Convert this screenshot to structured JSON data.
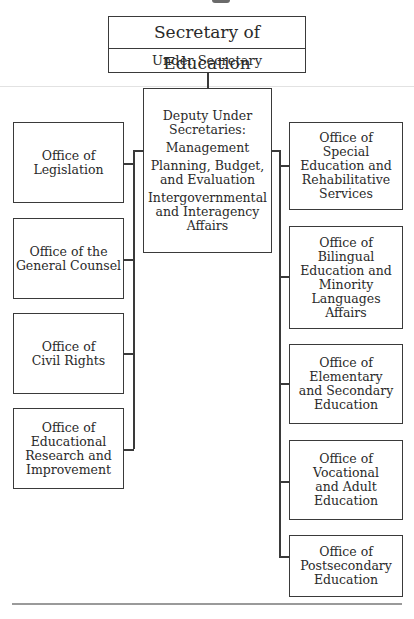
{
  "header": {
    "top": {
      "title": "Secretary of Education",
      "subtitle": "Under Secretary"
    }
  },
  "deputy": {
    "heading": [
      "Deputy Under",
      "Secretaries:"
    ],
    "items": [
      [
        "Management"
      ],
      [
        "Planning, Budget,",
        "and Evaluation"
      ],
      [
        "Intergovernmental",
        "and Interagency",
        "Affairs"
      ]
    ]
  },
  "left_offices": [
    {
      "lines": [
        "Office of",
        "Legislation"
      ]
    },
    {
      "lines": [
        "Office of the",
        "General Counsel"
      ]
    },
    {
      "lines": [
        "Office of",
        "Civil Rights"
      ]
    },
    {
      "lines": [
        "Office of",
        "Educational",
        "Research and",
        "Improvement"
      ]
    }
  ],
  "right_offices": [
    {
      "lines": [
        "Office of",
        "Special",
        "Education and",
        "Rehabilitative",
        "Services"
      ]
    },
    {
      "lines": [
        "Office of",
        "Bilingual",
        "Education and",
        "Minority",
        "Languages",
        "Affairs"
      ]
    },
    {
      "lines": [
        "Office of",
        "Elementary",
        "and Secondary",
        "Education"
      ]
    },
    {
      "lines": [
        "Office of",
        "Vocational",
        "and Adult",
        "Education"
      ]
    },
    {
      "lines": [
        "Office of",
        "Postsecondary",
        "Education"
      ]
    }
  ],
  "colors": {
    "line": "#3a3a3a",
    "text": "#2a2a2a",
    "rule": "#cfcfcf"
  }
}
